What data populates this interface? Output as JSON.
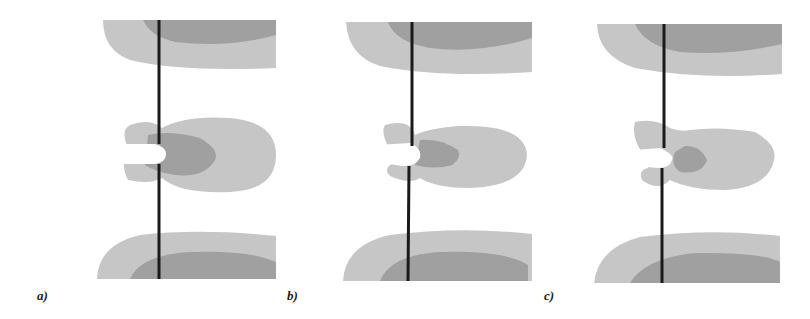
{
  "figure": {
    "panels": [
      {
        "label": "a)",
        "id": "a"
      },
      {
        "label": "b)",
        "id": "b"
      },
      {
        "label": "c)",
        "id": "c"
      }
    ],
    "colors": {
      "background": "#ffffff",
      "light_contour": "#c6c6c6",
      "dark_contour": "#a0a0a0",
      "line": "#1a1a1a"
    }
  }
}
